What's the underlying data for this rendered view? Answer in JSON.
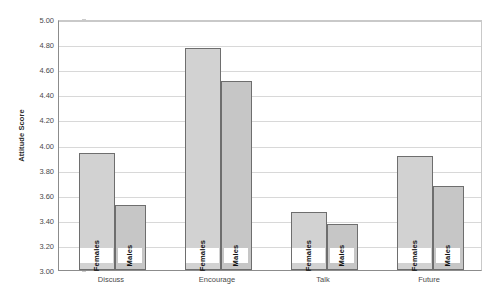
{
  "chart_data": {
    "type": "bar",
    "title": "",
    "xlabel": "",
    "ylabel": "Attitude Score",
    "ylim": [
      3.0,
      5.0
    ],
    "ytick_step": 0.2,
    "ytick_labels": [
      "5.00",
      "4.80",
      "4.60",
      "4.40",
      "4.20",
      "4.00",
      "3.80",
      "3.60",
      "3.40",
      "3.20",
      "3.00"
    ],
    "ytick_values": [
      5.0,
      4.8,
      4.6,
      4.4,
      4.2,
      4.0,
      3.8,
      3.6,
      3.4,
      3.2,
      3.0
    ],
    "grid": true,
    "legend_position": "in-bar-labels",
    "categories": [
      "Discuss",
      "Encourage",
      "Talk",
      "Future"
    ],
    "series": [
      {
        "name": "Females",
        "values": [
          3.93,
          4.77,
          3.46,
          3.91
        ]
      },
      {
        "name": "Males",
        "values": [
          3.52,
          4.51,
          3.37,
          3.67
        ]
      }
    ],
    "colors": {
      "females_fill": "#d2d2d2",
      "males_fill": "#c6c6c6",
      "bar_border": "#6e6e6e",
      "gridline": "#d8d8d8",
      "axis": "#8c8c8c",
      "text": "#4a4a4a",
      "background": "#ffffff"
    }
  }
}
